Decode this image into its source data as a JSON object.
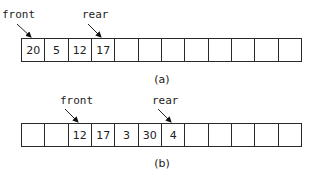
{
  "diagrams": [
    {
      "caption": "(a)",
      "cells": [
        "20",
        "5",
        "12",
        "17",
        "",
        "",
        "",
        "",
        "",
        "",
        "",
        ""
      ],
      "pointers": {
        "front": {
          "label": "front",
          "index": 0
        },
        "rear": {
          "label": "rear",
          "index": 3
        }
      }
    },
    {
      "caption": "(b)",
      "cells": [
        "",
        "",
        "12",
        "17",
        "3",
        "30",
        "4",
        "",
        "",
        "",
        "",
        ""
      ],
      "pointers": {
        "front": {
          "label": "front",
          "index": 2
        },
        "rear": {
          "label": "rear",
          "index": 6
        }
      }
    }
  ]
}
